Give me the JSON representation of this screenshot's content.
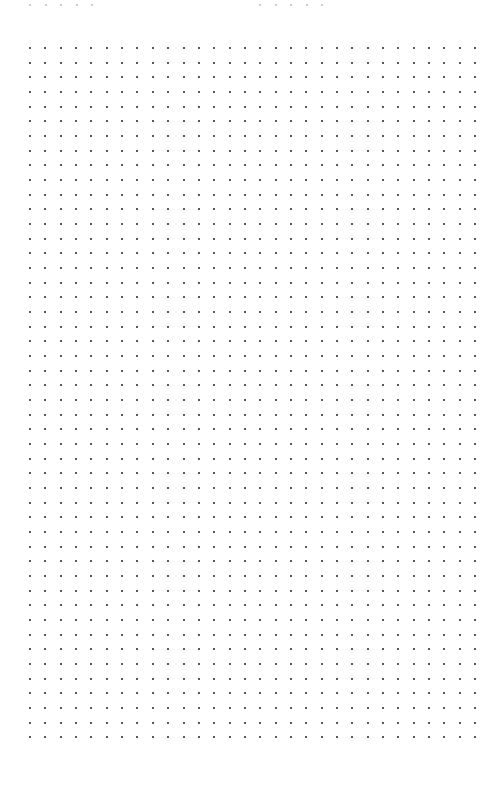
{
  "page": {
    "type": "dot-grid-paper",
    "background_color": "#ffffff",
    "dot_color": "#222222",
    "ghost_dot_color": "#bdbdbd"
  },
  "grid": {
    "columns": 30,
    "rows": 48,
    "origin_x": 30,
    "origin_y": 48,
    "spacing_x": 15.35,
    "spacing_y": 14.67,
    "dot_size": 2
  },
  "ghost_rows": [
    {
      "y": 5,
      "xs": [
        30,
        46,
        61,
        77,
        92
      ]
    },
    {
      "y": 5,
      "xs": [
        260,
        276,
        291,
        307,
        322
      ]
    }
  ]
}
